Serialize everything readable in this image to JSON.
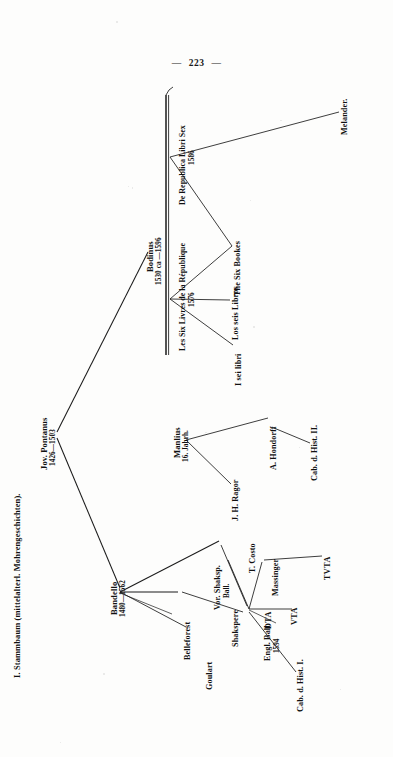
{
  "page": {
    "number": "223",
    "dash_left": "—",
    "dash_right": "—"
  },
  "figure": {
    "title": "I. Stammbaum (mittelalterl. Mohrengeschichten).",
    "orientation": "rotated-90-ccw"
  },
  "tree": {
    "root": {
      "name": "Jov. Pontanus",
      "dates": "1426—1503"
    },
    "branches": [
      {
        "name": "Bandello",
        "dates": "1480—1562",
        "children": [
          {
            "name": "Belleforest"
          },
          {
            "name": "Vor. Shaksp.",
            "sub": "Ball."
          },
          {
            "name": "Goulart"
          },
          {
            "name": "T. Costo"
          },
          {
            "name": "Massinger"
          },
          {
            "name": "Shakspere"
          },
          {
            "name": "Engl. Ball.",
            "sub": "1594"
          },
          {
            "name": "DTA"
          },
          {
            "name": "VTA"
          },
          {
            "name": "TVTA"
          },
          {
            "name": "Cab. d. Hist. I."
          }
        ]
      },
      {
        "name": "Bodinus",
        "dates": "1530 ca —1596",
        "works": [
          {
            "name": "Les Six Livres de la République",
            "year": "1576"
          },
          {
            "name": "De Republica Libri Sex",
            "year": "1586"
          }
        ],
        "children": [
          {
            "name": "Melander."
          },
          {
            "name": "The Six Bookes"
          },
          {
            "name": "Los seis Libros"
          },
          {
            "name": "I sei libri"
          }
        ]
      },
      {
        "name": "Manlius",
        "dates": "16. Jahrh.",
        "children": [
          {
            "name": "J. H. Ragor"
          },
          {
            "name": "A. Hondorff"
          },
          {
            "name": "Cab. d. Hist. II."
          }
        ]
      }
    ]
  }
}
